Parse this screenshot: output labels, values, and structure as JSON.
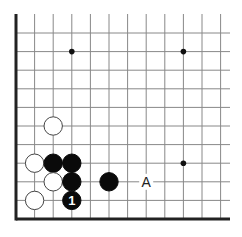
{
  "diagram": {
    "type": "go-board-corner",
    "grid": {
      "x0": 16,
      "y0": 219,
      "spacing": 18.6,
      "cols": 12,
      "rows": 11,
      "extend_right": 230,
      "extend_top": 14,
      "line_color": "#888888",
      "edge_color": "#222222"
    },
    "star_points": [
      {
        "col": 3,
        "row": 9
      },
      {
        "col": 9,
        "row": 9
      },
      {
        "col": 9,
        "row": 3
      }
    ],
    "stones": [
      {
        "color": "white",
        "col": 2,
        "row": 5,
        "label": ""
      },
      {
        "color": "white",
        "col": 1,
        "row": 3,
        "label": ""
      },
      {
        "color": "black",
        "col": 2,
        "row": 3,
        "label": ""
      },
      {
        "color": "black",
        "col": 3,
        "row": 3,
        "label": ""
      },
      {
        "color": "white",
        "col": 2,
        "row": 2,
        "label": ""
      },
      {
        "color": "black",
        "col": 3,
        "row": 2,
        "label": ""
      },
      {
        "color": "black",
        "col": 5,
        "row": 2,
        "label": ""
      },
      {
        "color": "white",
        "col": 1,
        "row": 1,
        "label": ""
      },
      {
        "color": "black",
        "col": 3,
        "row": 1,
        "label": "1"
      }
    ],
    "markers": [
      {
        "text": "A",
        "col": 7,
        "row": 2
      }
    ]
  }
}
